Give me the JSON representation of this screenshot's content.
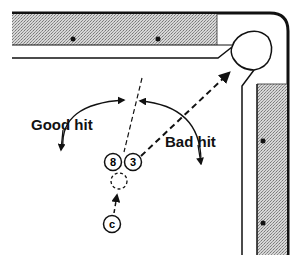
{
  "diagram": {
    "labels": {
      "good_hit": "Good hit",
      "bad_hit": "Bad hit"
    },
    "balls": {
      "eight": "8",
      "three": "3",
      "cue": "c"
    },
    "colors": {
      "line": "#111111",
      "rail_fill": "#b8b8b8",
      "background": "#ffffff"
    }
  }
}
